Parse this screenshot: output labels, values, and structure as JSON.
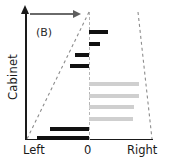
{
  "figure": {
    "panel_label": "(B)",
    "background_color": "#ffffff"
  },
  "axes": {
    "y_title": "Cabinet",
    "x_tick_labels": [
      "Left",
      "0",
      "Right"
    ],
    "zero_position_label": "0"
  },
  "annotations": {
    "trend_arrow": {
      "name": "rightward-arrow",
      "direction": "right"
    }
  },
  "colors": {
    "dark_bar": "#111111",
    "light_bar": "#cfcfcf",
    "axis": "#1a1a1a",
    "dashed_envelope": "#8c8c8c",
    "arrow": "#5e5e5e"
  },
  "chart_data": {
    "type": "bar",
    "orientation": "horizontal",
    "title": "",
    "subtitle": "(B)",
    "xlabel": "",
    "ylabel": "Cabinet",
    "xlim": [
      -1.0,
      1.0
    ],
    "x_tick_values": [
      -1.0,
      0.0,
      1.0
    ],
    "x_tick_labels": [
      "Left",
      "0",
      "Right"
    ],
    "grid": false,
    "legend": null,
    "zero_reference": 0.0,
    "series": [
      {
        "name": "dark",
        "color": "#111111",
        "values": [
          0.3,
          0.17,
          -0.22,
          -0.3,
          -0.62,
          -0.82
        ]
      },
      {
        "name": "light",
        "color": "#cfcfcf",
        "values": [
          0.8,
          0.79,
          0.72,
          0.7
        ]
      }
    ],
    "bars": [
      {
        "index": 1,
        "series": "dark",
        "value": 0.3,
        "y_frac": 0.125
      },
      {
        "index": 2,
        "series": "dark",
        "value": 0.17,
        "y_frac": 0.225
      },
      {
        "index": 3,
        "series": "dark",
        "value": -0.22,
        "y_frac": 0.315
      },
      {
        "index": 4,
        "series": "dark",
        "value": -0.3,
        "y_frac": 0.4
      },
      {
        "index": 5,
        "series": "light",
        "value": 0.8,
        "y_frac": 0.545
      },
      {
        "index": 6,
        "series": "light",
        "value": 0.79,
        "y_frac": 0.64
      },
      {
        "index": 7,
        "series": "light",
        "value": 0.72,
        "y_frac": 0.73
      },
      {
        "index": 8,
        "series": "light",
        "value": 0.7,
        "y_frac": 0.82
      },
      {
        "index": 9,
        "series": "dark",
        "value": -0.62,
        "y_frac": 0.905
      },
      {
        "index": 10,
        "series": "dark",
        "value": -0.82,
        "y_frac": 0.975
      }
    ],
    "envelope": {
      "left_line": {
        "top_x": 0.0,
        "bottom_x": -1.0,
        "style": "dashed"
      },
      "right_line": {
        "top_x": 0.78,
        "bottom_x": 1.0,
        "style": "dashed"
      }
    }
  }
}
